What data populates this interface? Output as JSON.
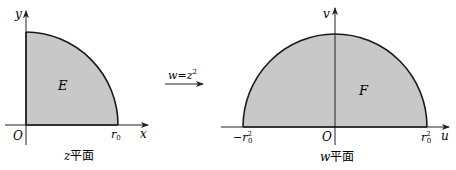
{
  "colors": {
    "fill": "#c8c8c8",
    "stroke": "#1a1a1a",
    "axis": "#333333"
  },
  "left_plane": {
    "caption_var": "z",
    "caption_text": "平面",
    "region_label": "E",
    "origin_label": "O",
    "x_axis_label": "x",
    "y_axis_label": "y",
    "radius_label": "r",
    "radius_sub": "0"
  },
  "mapping": {
    "label_lhs": "w",
    "label_eq": "=",
    "label_rhs": "z",
    "label_exp": "2"
  },
  "right_plane": {
    "caption_var": "w",
    "caption_text": "平面",
    "region_label": "F",
    "origin_label": "O",
    "x_axis_label": "u",
    "y_axis_label": "v",
    "neg_label_sign": "−",
    "radius_label": "r",
    "radius_sub": "0",
    "radius_exp": "2"
  }
}
